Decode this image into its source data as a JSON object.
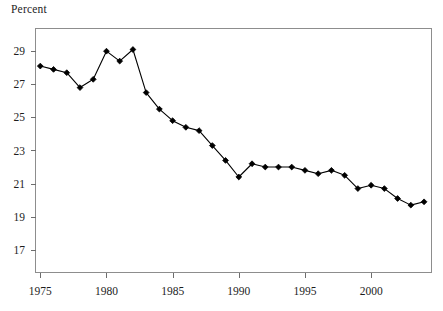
{
  "chart_data": {
    "type": "line",
    "title": "",
    "subtitle": "",
    "ylabel": "Percent",
    "xlabel": "",
    "grid": false,
    "legend": null,
    "marker": "diamond",
    "line_color": "#000000",
    "marker_color": "#000000",
    "frame_color": "#8d8d8d",
    "xlim": [
      1974.6,
      2004.6
    ],
    "ylim": [
      15.6,
      30.4
    ],
    "x_ticks": [
      1975,
      1980,
      1985,
      1990,
      1995,
      2000
    ],
    "x_tick_labels": [
      "1975",
      "1980",
      "1985",
      "1990",
      "1995",
      "2000"
    ],
    "y_ticks": [
      17,
      19,
      21,
      23,
      25,
      27,
      29
    ],
    "y_tick_labels": [
      "17",
      "19",
      "21",
      "23",
      "25",
      "27",
      "29"
    ],
    "x": [
      1975,
      1976,
      1977,
      1978,
      1979,
      1980,
      1981,
      1982,
      1983,
      1984,
      1985,
      1986,
      1987,
      1988,
      1989,
      1990,
      1991,
      1992,
      1993,
      1994,
      1995,
      1996,
      1997,
      1998,
      1999,
      2000,
      2001,
      2002,
      2003,
      2004
    ],
    "values": [
      28.1,
      27.9,
      27.7,
      26.8,
      27.3,
      29.0,
      28.4,
      29.1,
      26.5,
      25.5,
      24.8,
      24.4,
      24.2,
      23.3,
      22.4,
      21.4,
      22.2,
      22.0,
      22.0,
      22.0,
      21.8,
      21.6,
      21.8,
      21.5,
      20.7,
      20.9,
      20.7,
      20.1,
      19.7,
      19.9
    ],
    "series": [
      {
        "name": "Percent",
        "values": [
          28.1,
          27.9,
          27.7,
          26.8,
          27.3,
          29.0,
          28.4,
          29.1,
          26.5,
          25.5,
          24.8,
          24.4,
          24.2,
          23.3,
          22.4,
          21.4,
          22.2,
          22.0,
          22.0,
          22.0,
          21.8,
          21.6,
          21.8,
          21.5,
          20.7,
          20.9,
          20.7,
          20.1,
          19.7,
          19.9
        ]
      }
    ]
  },
  "axis": {
    "y_title": "Percent"
  }
}
